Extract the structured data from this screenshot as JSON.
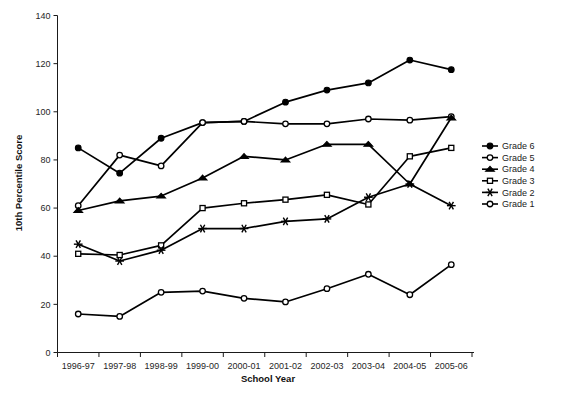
{
  "chart_data": {
    "type": "line",
    "title": "",
    "xlabel": "School Year",
    "ylabel": "10th Percentile Score",
    "categories": [
      "1996-97",
      "1997-98",
      "1998-99",
      "1999-00",
      "2000-01",
      "2001-02",
      "2002-03",
      "2003-04",
      "2004-05",
      "2005-06"
    ],
    "ylim": [
      0,
      140
    ],
    "yticks": [
      0,
      20,
      40,
      60,
      80,
      100,
      120,
      140
    ],
    "grid": false,
    "legend_position": "right",
    "series": [
      {
        "name": "Grade 6",
        "marker": "filled-circle",
        "values": [
          85,
          74.5,
          89,
          95.5,
          96,
          104,
          109,
          112,
          121.5,
          117.5
        ]
      },
      {
        "name": "Grade 5",
        "marker": "open-circle",
        "values": [
          61,
          82,
          77.5,
          95.5,
          96,
          95,
          95,
          97,
          96.5,
          98
        ]
      },
      {
        "name": "Grade 4",
        "marker": "filled-triangle",
        "values": [
          59,
          63,
          65,
          72.5,
          81.5,
          80,
          86.5,
          86.5,
          70,
          97.5
        ]
      },
      {
        "name": "Grade 3",
        "marker": "open-square",
        "values": [
          41,
          40.5,
          44.5,
          60,
          62,
          63.5,
          65.5,
          61.5,
          81.5,
          85
        ]
      },
      {
        "name": "Grade 2",
        "marker": "asterisk",
        "values": [
          45,
          38,
          42.5,
          51.5,
          51.5,
          54.5,
          55.5,
          64.5,
          70,
          61
        ]
      },
      {
        "name": "Grade 1",
        "marker": "open-circle",
        "values": [
          16,
          15,
          25,
          25.5,
          22.5,
          21,
          26.5,
          32.5,
          24,
          36.5
        ]
      }
    ]
  },
  "axes": {
    "y_label": "10th Percentile Score",
    "x_label": "School Year",
    "y_tick_labels": [
      "0",
      "20",
      "40",
      "60",
      "80",
      "100",
      "120",
      "140"
    ],
    "x_tick_labels": [
      "1996-97",
      "1997-98",
      "1998-99",
      "1999-00",
      "2000-01",
      "2001-02",
      "2002-03",
      "2003-04",
      "2004-05",
      "2005-06"
    ]
  },
  "legend": {
    "items": [
      {
        "label": "Grade 6",
        "marker": "filled-circle"
      },
      {
        "label": "Grade 5",
        "marker": "open-circle"
      },
      {
        "label": "Grade 4",
        "marker": "filled-triangle"
      },
      {
        "label": "Grade 3",
        "marker": "open-square"
      },
      {
        "label": "Grade 2",
        "marker": "asterisk"
      },
      {
        "label": "Grade 1",
        "marker": "open-circle"
      }
    ]
  },
  "colors": {
    "line": "#000000",
    "axis": "#1a1a1a",
    "background": "#ffffff"
  }
}
